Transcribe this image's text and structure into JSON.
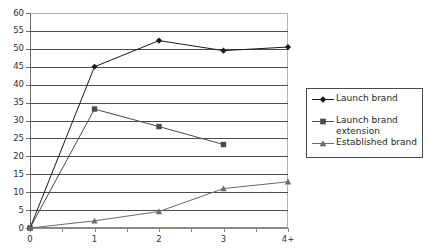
{
  "chart_data": {
    "type": "line",
    "title": "",
    "xlabel": "",
    "ylabel": "",
    "categories": [
      "0",
      "1",
      "2",
      "3",
      "4+"
    ],
    "ylim": [
      0,
      60
    ],
    "yticks": [
      0,
      5,
      10,
      15,
      20,
      25,
      30,
      35,
      40,
      45,
      50,
      55,
      60
    ],
    "ytick_labels": [
      "0",
      "5",
      "10",
      "15",
      "20",
      "25",
      "30",
      "35",
      "40",
      "45",
      "50",
      "55",
      "60"
    ],
    "grid": true,
    "legend_position": "right",
    "series": [
      {
        "name": "Launch brand",
        "marker": "diamond",
        "color": "#1a1a1a",
        "values": [
          0,
          45,
          52.3,
          49.5,
          50.5
        ]
      },
      {
        "name": "Launch brand extension",
        "marker": "square",
        "color": "#4a4a4a",
        "values": [
          0,
          33.2,
          28.3,
          23.3,
          null
        ]
      },
      {
        "name": "Established brand",
        "marker": "triangle",
        "color": "#6a6a6a",
        "values": [
          0,
          2.0,
          4.6,
          11.0,
          12.9
        ]
      }
    ]
  },
  "legend": {
    "entries": [
      {
        "label": "Launch brand",
        "marker": "diamond"
      },
      {
        "label": "Launch brand\nextension",
        "marker": "square"
      },
      {
        "label": "Established brand",
        "marker": "triangle"
      }
    ]
  },
  "colors": {
    "gridline": "#4d4d4d",
    "axis": "#8a8a8a",
    "plot_border": "#b4b4b4",
    "text": "#2f2f34",
    "legend_border": "#4a4a4a"
  }
}
